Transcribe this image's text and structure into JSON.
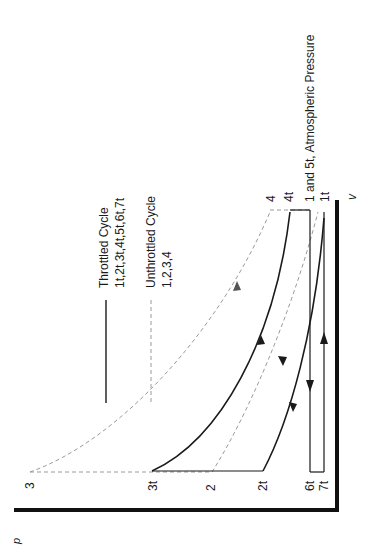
{
  "diagram": {
    "type": "p-v diagram (rotated 90 degrees counter-clockwise)",
    "axes": {
      "x_label": "v",
      "y_label": "p"
    },
    "legend": {
      "throttled": {
        "title": "Throttled Cycle",
        "points": "1t,2t,3t,4t,5t,6t,7t",
        "style": "solid"
      },
      "unthrottled": {
        "title": "Unthrottled Cycle",
        "points": "1,2,3,4",
        "style": "dashed"
      }
    },
    "point_labels": {
      "p3": "3",
      "p3t": "3t",
      "p2": "2",
      "p2t": "2t",
      "p6t": "6t",
      "p7t": "7t",
      "p4": "4",
      "p4t": "4t",
      "p1t": "1t",
      "p1_5t": "1 and 5t, Atmospheric Pressure"
    },
    "colors": {
      "line": "#1a1a1a",
      "dashed": "#9a9a9a",
      "axis": "#111111"
    }
  }
}
